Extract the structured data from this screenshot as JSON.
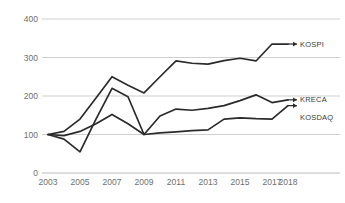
{
  "chart_data": {
    "type": "line",
    "title": "",
    "subtitle": "",
    "xlabel": "",
    "ylabel": "",
    "grid": "horizontal",
    "legend_position": "right-inline-labels",
    "x": [
      2003,
      2004,
      2005,
      2006,
      2007,
      2008,
      2009,
      2010,
      2011,
      2012,
      2013,
      2014,
      2015,
      2016,
      2017,
      2018
    ],
    "xtick_labels": [
      "2003",
      "2005",
      "2007",
      "2009",
      "2011",
      "2013",
      "2015",
      "2017",
      "2018"
    ],
    "xtick_values": [
      2003,
      2005,
      2007,
      2009,
      2011,
      2013,
      2015,
      2017,
      2018
    ],
    "ytick_labels": [
      "0",
      "100",
      "200",
      "300",
      "400"
    ],
    "ytick_values": [
      0,
      100,
      200,
      300,
      400
    ],
    "ylim": [
      0,
      400
    ],
    "xlim": [
      2003,
      2018
    ],
    "series": [
      {
        "name": "KOSPI",
        "label": "KOSPI",
        "color": "#2b2b2b",
        "values": [
          100,
          108,
          140,
          195,
          250,
          228,
          208,
          250,
          291,
          285,
          283,
          292,
          298,
          291,
          335,
          335
        ]
      },
      {
        "name": "KRECA",
        "label": "KRECA",
        "color": "#2b2b2b",
        "values": [
          100,
          88,
          55,
          140,
          220,
          198,
          100,
          148,
          166,
          163,
          168,
          175,
          188,
          203,
          183,
          190
        ]
      },
      {
        "name": "KOSDAQ",
        "label": "KOSDAQ",
        "color": "#2b2b2b",
        "values": [
          100,
          97,
          108,
          128,
          152,
          128,
          100,
          104,
          107,
          110,
          112,
          140,
          143,
          141,
          140,
          175
        ]
      }
    ]
  },
  "axis": {
    "y_labels": [
      "400",
      "300",
      "200",
      "100",
      "0"
    ],
    "x_labels": [
      "2003",
      "2005",
      "2007",
      "2009",
      "2011",
      "2013",
      "2015",
      "2017",
      "2018"
    ]
  },
  "labels": {
    "kospi": "KOSPI",
    "kreca": "KRECA",
    "kosdaq": "KOSDAQ"
  },
  "colors": {
    "line": "#2b2b2b",
    "grid": "#c9c9c9",
    "axis": "#b4b4b4",
    "tick_text": "#6e6e6e",
    "label_text": "#3a3a3a",
    "background": "#ffffff"
  }
}
